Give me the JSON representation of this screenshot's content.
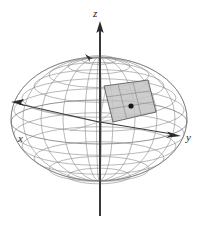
{
  "figure": {
    "title": "",
    "kind": "3d-ellipsoid-wireframe-with-surface-patch",
    "background_color": "#ffffff"
  },
  "axes": {
    "z": {
      "label": "z",
      "label_x": 97,
      "label_y": 13,
      "direction": "up",
      "arrow_tip_x": 100,
      "arrow_tip_y": 24,
      "line_start_x": 100,
      "line_start_y": 24,
      "line_end_x": 100,
      "line_end_y": 216,
      "color": "#2b2b2b"
    },
    "y": {
      "label": "y",
      "label_x": 190,
      "label_y": 140,
      "direction": "right",
      "arrow_tip_x": 180,
      "arrow_tip_y": 135,
      "line_start_x": 100,
      "line_start_y": 122,
      "line_end_x": 180,
      "line_end_y": 135,
      "color": "#2b2b2b"
    },
    "x": {
      "label": "x",
      "label_x": 22,
      "label_y": 139,
      "direction": "lower-left-toward-viewer",
      "arrow_tip_x": 13,
      "arrow_tip_y": 103,
      "line_start_x": 100,
      "line_start_y": 122,
      "line_end_x": 13,
      "line_end_y": 103,
      "color": "#2b2b2b"
    }
  },
  "ellipsoid": {
    "center_x": 99,
    "center_y": 119,
    "semi_axis_horizontal": 88,
    "semi_axis_vertical": 62,
    "equator_tilt_ry": 22,
    "parallels_count": 9,
    "meridians_count": 12,
    "wire_color": "#8a8a8a",
    "outline_color": "#707070"
  },
  "patch": {
    "name": "surface-element-patch",
    "fill_color": "#c4c4c4",
    "edge_color": "#5a5a5a",
    "corners": [
      [
        104,
        86
      ],
      [
        148,
        80
      ],
      [
        156,
        112
      ],
      [
        113,
        122
      ]
    ],
    "subdivisions_u": 3,
    "subdivisions_v": 3
  },
  "patch_point": {
    "name": "patch-center-point",
    "x": 131,
    "y": 106,
    "radius": 2.6,
    "color": "#141414"
  },
  "pole_marker": {
    "name": "pole-tick-marker",
    "x": 89,
    "y": 57,
    "color": "#3a3a3a"
  }
}
